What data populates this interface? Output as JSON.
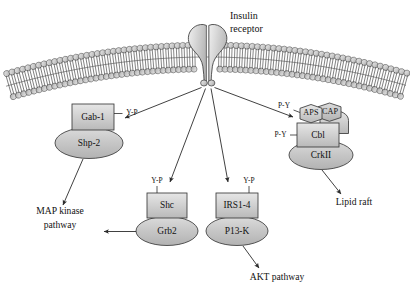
{
  "figure": {
    "receptor_label_line1": "Insulin",
    "receptor_label_line2": "receptor"
  },
  "colors": {
    "outline": "#2a2a2a",
    "node_fill_light": "#d8d8d8",
    "node_fill_mid": "#c9c9c9",
    "node_fill_dark": "#bdbdbd",
    "membrane_fill": "#cfcfcf",
    "text": "#121212",
    "background": "#ffffff"
  },
  "membrane": {
    "name": "plasma-membrane",
    "type": "phospholipid-bilayer",
    "leaflets": 2
  },
  "receptor": {
    "name": "insulin-receptor",
    "subunits": 2,
    "label_line1": "Insulin",
    "label_line2": "receptor"
  },
  "complexes": [
    {
      "id": "gab1-shp2",
      "adaptor": {
        "label": "Gab-1",
        "shape": "rect"
      },
      "effector": {
        "label": "Shp-2",
        "shape": "ellipse"
      },
      "phospho_label": "Y-P",
      "phospho_side": "right"
    },
    {
      "id": "shc-grb2",
      "adaptor": {
        "label": "Shc",
        "shape": "rect"
      },
      "effector": {
        "label": "Grb2",
        "shape": "ellipse"
      },
      "phospho_label": "Y-P",
      "phospho_side": "top-left"
    },
    {
      "id": "irs-pi3k",
      "adaptor": {
        "label": "IRS1-4",
        "shape": "rect"
      },
      "effector": {
        "label": "P13-K",
        "shape": "ellipse"
      },
      "phospho_label": "Y-P",
      "phospho_side": "top-right"
    },
    {
      "id": "cap-cbl-crkii",
      "members": [
        {
          "label": "APS",
          "shape": "hexagon"
        },
        {
          "label": "CAP",
          "shape": "hexagon"
        },
        {
          "label": "Cbl",
          "shape": "rect"
        },
        {
          "label": "CrkII",
          "shape": "ellipse"
        }
      ],
      "phospho_labels": [
        "P-Y",
        "P-Y"
      ]
    }
  ],
  "outputs": [
    {
      "id": "map-kinase",
      "line1": "MAP kinase",
      "line2": "pathway"
    },
    {
      "id": "akt",
      "line1": "AKT pathway",
      "line2": ""
    },
    {
      "id": "lipid-raft",
      "line1": "Lipid raft",
      "line2": ""
    }
  ],
  "labels": {
    "gab1": "Gab-1",
    "shp2": "Shp-2",
    "shc": "Shc",
    "grb2": "Grb2",
    "irs": "IRS1-4",
    "pi3k": "P13-K",
    "aps": "APS",
    "cap": "CAP",
    "cbl": "Cbl",
    "crkii": "CrkII",
    "yp_gab1": "Y-P",
    "yp_shc": "Y-P",
    "yp_irs": "Y-P",
    "py_aps": "P-Y",
    "py_cbl": "P-Y",
    "map_kinase_l1": "MAP kinase",
    "map_kinase_l2": "pathway",
    "akt": "AKT pathway",
    "lipid_raft": "Lipid raft",
    "insulin": "Insulin",
    "receptor": "receptor"
  }
}
